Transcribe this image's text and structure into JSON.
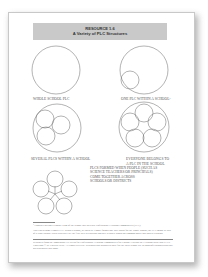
{
  "resource": {
    "number": "RESOURCE 1.6",
    "title": "A Variety of PLC Structures"
  },
  "diagrams": [
    {
      "label": "WHOLE SCHOOL PLC"
    },
    {
      "label": "ONE PLC WITHIN A SCHOOL¹"
    },
    {
      "label": "SEVERAL PLCS WITHIN A SCHOOL"
    },
    {
      "label_line1": "EVERYONE BELONGS TO",
      "label_line2": "A PLC IN THE SCHOOL"
    },
    {
      "desc_lines": [
        "PLCS FORMED WHEN PEOPLE (SUCH AS",
        "SCIENCE TEACHERS OR PRINCIPALS)",
        "COME TOGETHER ACROSS",
        "SCHOOLS OR DISTRICTS"
      ]
    }
  ],
  "footnotes": {
    "note1": "¹ Consider having a Google team of the school that uses our Professional Learning Communities (PLC).",
    "note2": "This can become a small PLC within a school, or could be a more formal one that works for the whole school; the PLC might be part of a larger group. Such structures are the first step to working together within a school on common goals and shared learning.",
    "source": "Reprinted from the companion CD-ROM for Professional Learning Communities for Change: Putting the Learning Back into PLCs. Copyright © by Corwin Press. All rights reserved. Reproduction authorized only for the local school site or nonprofit organization that has purchased this book."
  }
}
